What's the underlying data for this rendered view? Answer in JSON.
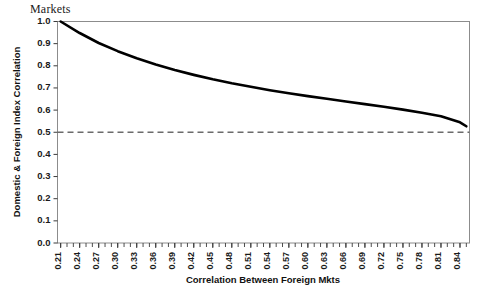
{
  "caption": {
    "fragment": "Markets"
  },
  "chart_data": {
    "type": "line",
    "title": "",
    "xlabel": "Correlation Between Foreign Mkts",
    "ylabel": "Domestic & Foreign Index Correlation",
    "xlim": [
      0.205,
      0.855
    ],
    "ylim": [
      0.0,
      1.0
    ],
    "grid": false,
    "legend_position": "none",
    "x_tick_labels": [
      "0.21",
      "0.24",
      "0.27",
      "0.30",
      "0.33",
      "0.36",
      "0.39",
      "0.42",
      "0.45",
      "0.48",
      "0.51",
      "0.54",
      "0.57",
      "0.60",
      "0.63",
      "0.66",
      "0.69",
      "0.72",
      "0.75",
      "0.78",
      "0.81",
      "0.84"
    ],
    "x_tick_values": [
      0.21,
      0.24,
      0.27,
      0.3,
      0.33,
      0.36,
      0.39,
      0.42,
      0.45,
      0.48,
      0.51,
      0.54,
      0.57,
      0.6,
      0.63,
      0.66,
      0.69,
      0.72,
      0.75,
      0.78,
      0.81,
      0.84
    ],
    "x_minor_tick_step": 0.01,
    "y_tick_labels": [
      "0.0",
      "0.1",
      "0.2",
      "0.3",
      "0.4",
      "0.5",
      "0.6",
      "0.7",
      "0.8",
      "0.9",
      "1.0"
    ],
    "y_tick_values": [
      0.0,
      0.1,
      0.2,
      0.3,
      0.4,
      0.5,
      0.6,
      0.7,
      0.8,
      0.9,
      1.0
    ],
    "series": [
      {
        "name": "Domestic & Foreign Index Correlation",
        "style": "solid",
        "color": "#000000",
        "x": [
          0.21,
          0.24,
          0.27,
          0.3,
          0.33,
          0.36,
          0.39,
          0.42,
          0.45,
          0.48,
          0.51,
          0.54,
          0.57,
          0.6,
          0.63,
          0.66,
          0.69,
          0.72,
          0.75,
          0.78,
          0.81,
          0.84,
          0.85
        ],
        "values": [
          1.0,
          0.948,
          0.903,
          0.866,
          0.834,
          0.806,
          0.781,
          0.759,
          0.739,
          0.721,
          0.705,
          0.69,
          0.676,
          0.663,
          0.651,
          0.639,
          0.627,
          0.615,
          0.602,
          0.588,
          0.572,
          0.545,
          0.527
        ]
      },
      {
        "name": "Reference level",
        "style": "dashed",
        "color": "#6b6b6b",
        "x": [
          0.205,
          0.855
        ],
        "values": [
          0.5,
          0.5
        ]
      }
    ],
    "annotations": []
  },
  "colors": {
    "series_line": "#000000",
    "reference_line": "#6b6b6b",
    "frame": "#8c8c8c",
    "text": "#1a1a1a",
    "background": "#ffffff"
  }
}
